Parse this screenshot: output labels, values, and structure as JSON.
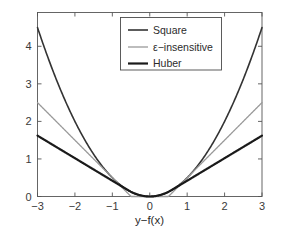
{
  "chart_data": {
    "type": "line",
    "title": "",
    "xlabel": "y−f(x)",
    "ylabel": "",
    "xlim": [
      -3,
      3
    ],
    "ylim": [
      0,
      4.9
    ],
    "xticks": [
      "-3",
      "-2",
      "-1",
      "0",
      "1",
      "2",
      "3"
    ],
    "xtick_values": [
      -3,
      -2,
      -1,
      0,
      1,
      2,
      3
    ],
    "yticks": [
      "0",
      "1",
      "2",
      "3",
      "4"
    ],
    "ytick_values": [
      0,
      1,
      2,
      3,
      4
    ],
    "grid": false,
    "legend_position": "upper center",
    "background": "#ffffff",
    "axes_color": "#555555",
    "series": [
      {
        "name": "Square",
        "color": "#333333",
        "width": 1.6,
        "formula": "0.5 * x^2",
        "x": [
          -3,
          -2.5,
          -2,
          -1.5,
          -1,
          -0.5,
          0,
          0.5,
          1,
          1.5,
          2,
          2.5,
          3
        ],
        "values": [
          4.5,
          3.125,
          2.0,
          1.125,
          0.5,
          0.125,
          0.0,
          0.125,
          0.5,
          1.125,
          2.0,
          3.125,
          4.5
        ]
      },
      {
        "name": "ε−insensitive",
        "color": "#9a9a9a",
        "width": 1.3,
        "formula": "max(0, |x| - 0.5)",
        "x": [
          -3,
          -2.5,
          -2,
          -1.5,
          -1,
          -0.5,
          0,
          0.5,
          1,
          1.5,
          2,
          2.5,
          3
        ],
        "values": [
          2.5,
          2.0,
          1.5,
          1.0,
          0.5,
          0.0,
          0.0,
          0.0,
          0.5,
          1.0,
          1.5,
          2.0,
          2.5
        ]
      },
      {
        "name": "Huber",
        "color": "#1a1a1a",
        "width": 2.2,
        "formula": "0.5x^2 for |x|<=0.6 ; 0.6(|x|-0.3) otherwise",
        "x": [
          -3,
          -2.5,
          -2,
          -1.5,
          -1,
          -0.6,
          -0.3,
          0,
          0.3,
          0.6,
          1,
          1.5,
          2,
          2.5,
          3
        ],
        "values": [
          1.35,
          1.11,
          0.87,
          0.63,
          0.39,
          0.18,
          0.045,
          0.0,
          0.045,
          0.18,
          0.39,
          0.63,
          0.87,
          1.11,
          1.35
        ]
      }
    ]
  },
  "legend": {
    "entries": [
      {
        "label": "Square"
      },
      {
        "label": "ε−insensitive"
      },
      {
        "label": "Huber"
      }
    ]
  },
  "axis": {
    "xlabel": "y−f(x)"
  }
}
